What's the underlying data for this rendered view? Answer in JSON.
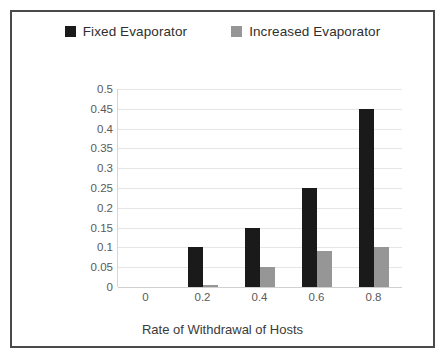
{
  "chart_data": {
    "type": "bar",
    "title": "",
    "subtitle": "",
    "xlabel": "Rate of Withdrawal of Hosts",
    "ylabel": "Rate of Failure in VM Allocation",
    "categories": [
      "0",
      "0.2",
      "0.4",
      "0.6",
      "0.8"
    ],
    "series": [
      {
        "name": "Fixed Evaporator",
        "color": "#1a1a1a",
        "values": [
          0,
          0.1,
          0.15,
          0.25,
          0.45
        ]
      },
      {
        "name": "Increased Evaporator",
        "color": "#969696",
        "values": [
          0,
          0.005,
          0.05,
          0.09,
          0.1
        ]
      }
    ],
    "ylim": [
      0,
      0.5
    ],
    "ytick_step": 0.05,
    "ytick_labels": [
      "0.5",
      "0.45",
      "0.4",
      "0.35",
      "0.3",
      "0.25",
      "0.2",
      "0.15",
      "0.1",
      "0.05",
      "0"
    ],
    "grid": "horizontal",
    "legend_position": "top",
    "frame_color": "#4a4a4a",
    "gridline_color": "#e6e6e6",
    "background": "#ffffff"
  },
  "legend": {
    "entries": [
      {
        "label": "Fixed Evaporator",
        "swatch": "legend-swatch-black"
      },
      {
        "label": "Increased Evaporator",
        "swatch": "legend-swatch-gray"
      }
    ]
  },
  "axes": {
    "y_title": "Rate of Failure in VM Allocation",
    "x_title": "Rate of Withdrawal of Hosts"
  }
}
